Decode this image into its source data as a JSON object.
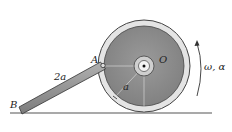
{
  "diagram": {
    "type": "mechanism",
    "labels": {
      "point_a": "A",
      "point_o": "O",
      "point_b": "B",
      "rod_length": "2a",
      "radius": "a",
      "angular": "ω, α"
    },
    "colors": {
      "wheel_rim": "#e6e6e6",
      "wheel_disk": "#8c8c8c",
      "rod": "#9a9a9a",
      "ground": "#555555",
      "line": "#333333"
    }
  }
}
